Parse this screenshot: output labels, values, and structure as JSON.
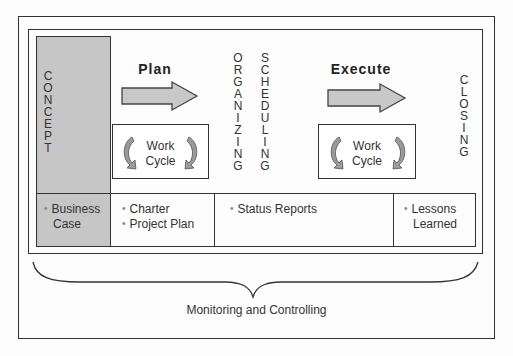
{
  "diagram": {
    "concept": {
      "label": "CONCEPT",
      "fill": "#c6c6c6"
    },
    "plan": {
      "title": "Plan",
      "work_cycle": "Work\nCycle",
      "work_cycle_line1": "Work",
      "work_cycle_line2": "Cycle"
    },
    "organizing": {
      "label": "ORGANIZING"
    },
    "scheduling": {
      "label": "SCHEDULING"
    },
    "execute": {
      "title": "Execute",
      "work_cycle_line1": "Work",
      "work_cycle_line2": "Cycle"
    },
    "closing": {
      "label": "CLOSING"
    },
    "deliverables": {
      "concept": [
        "Business",
        "Case"
      ],
      "plan": [
        "Charter",
        "Project Plan"
      ],
      "execute": [
        "Status Reports"
      ],
      "closing": [
        "Lessons",
        "Learned"
      ]
    },
    "brace_label": "Monitoring and Controlling",
    "colors": {
      "line": "#333333",
      "arrow_fill": "#c8c8c8",
      "concept_fill": "#c6c6c6"
    }
  }
}
